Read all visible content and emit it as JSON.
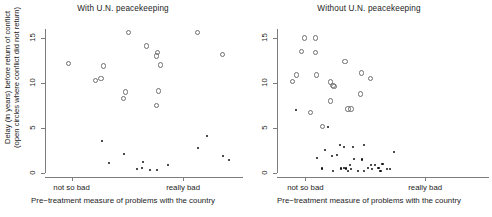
{
  "figure": {
    "background": "#ffffff",
    "marker_open_color": "#6f6f6f",
    "marker_solid_color": "#111111",
    "axis_color": "#7d7d7d"
  },
  "axis": {
    "ylabel_line1": "Delay (in years) before return of conflict",
    "ylabel_line2": "(open circles where conflict did not return)",
    "xlabel": "Pre−treatment measure of problems with the country",
    "xtick_labels": [
      "not so bad",
      "really bad"
    ],
    "ytick_labels": [
      "0",
      "5",
      "10",
      "15"
    ]
  },
  "chart_data": [
    {
      "type": "scatter",
      "title": "With U.N. peacekeeping",
      "xlabel": "Pre−treatment measure of problems with the country",
      "ylabel": "Delay (in years) before return of conflict (open circles where conflict did not return)",
      "xlim": [
        0,
        1
      ],
      "ylim": [
        0,
        16
      ],
      "yticks": [
        0,
        5,
        10,
        15
      ],
      "xticks": [
        0.13,
        0.72
      ],
      "xtick_labels": [
        "not so bad",
        "really bad"
      ],
      "grid": false,
      "legend": null,
      "series": [
        {
          "name": "conflict did not return (open circles)",
          "marker": "open-circle",
          "points": [
            [
              0.115,
              12.2
            ],
            [
              0.255,
              10.3
            ],
            [
              0.285,
              10.5
            ],
            [
              0.3,
              11.9
            ],
            [
              0.43,
              15.6
            ],
            [
              0.415,
              9.0
            ],
            [
              0.405,
              8.3
            ],
            [
              0.525,
              14.1
            ],
            [
              0.585,
              13.4
            ],
            [
              0.58,
              13.0
            ],
            [
              0.6,
              12.0
            ],
            [
              0.59,
              9.1
            ],
            [
              0.58,
              7.5
            ],
            [
              0.795,
              15.6
            ],
            [
              0.93,
              13.2
            ]
          ]
        },
        {
          "name": "conflict returned (solid dots)",
          "marker": "solid-dot",
          "points": [
            [
              0.29,
              3.6
            ],
            [
              0.33,
              1.1
            ],
            [
              0.405,
              2.1
            ],
            [
              0.475,
              0.4
            ],
            [
              0.51,
              1.2
            ],
            [
              0.505,
              0.6
            ],
            [
              0.545,
              0.35
            ],
            [
              0.58,
              0.35
            ],
            [
              0.64,
              0.85
            ],
            [
              0.8,
              2.8
            ],
            [
              0.845,
              4.1
            ],
            [
              0.93,
              1.9
            ],
            [
              0.965,
              1.4
            ]
          ]
        }
      ]
    },
    {
      "type": "scatter",
      "title": "Without U.N. peacekeeping",
      "xlabel": "Pre−treatment measure of problems with the country",
      "ylabel": "Delay (in years) before return of conflict (open circles where conflict did not return)",
      "xlim": [
        0,
        1
      ],
      "ylim": [
        0,
        16
      ],
      "yticks": [
        0,
        5,
        10,
        15
      ],
      "xticks": [
        0.13,
        0.72
      ],
      "xtick_labels": [
        "not so bad",
        "really bad"
      ],
      "grid": false,
      "legend": null,
      "series": [
        {
          "name": "conflict did not return (open circles)",
          "marker": "open-circle",
          "points": [
            [
              0.065,
              10.2
            ],
            [
              0.085,
              10.9
            ],
            [
              0.125,
              15.0
            ],
            [
              0.11,
              13.5
            ],
            [
              0.18,
              15.0
            ],
            [
              0.18,
              13.4
            ],
            [
              0.185,
              10.9
            ],
            [
              0.155,
              6.7
            ],
            [
              0.215,
              5.2
            ],
            [
              0.255,
              10.1
            ],
            [
              0.265,
              9.7
            ],
            [
              0.27,
              9.6
            ],
            [
              0.255,
              8.0
            ],
            [
              0.325,
              12.4
            ],
            [
              0.34,
              7.1
            ],
            [
              0.355,
              7.1
            ],
            [
              0.405,
              11.1
            ],
            [
              0.4,
              8.8
            ],
            [
              0.45,
              10.5
            ]
          ]
        },
        {
          "name": "conflict returned (solid dots)",
          "marker": "solid-dot",
          "points": [
            [
              0.085,
              7.0
            ],
            [
              0.24,
              5.1
            ],
            [
              0.225,
              2.6
            ],
            [
              0.185,
              1.7
            ],
            [
              0.26,
              1.9
            ],
            [
              0.21,
              0.5
            ],
            [
              0.265,
              0.2
            ],
            [
              0.305,
              0.5
            ],
            [
              0.3,
              3.1
            ],
            [
              0.32,
              2.9
            ],
            [
              0.285,
              2.0
            ],
            [
              0.32,
              0.6
            ],
            [
              0.33,
              0.5
            ],
            [
              0.34,
              0.2
            ],
            [
              0.355,
              0.4
            ],
            [
              0.365,
              2.9
            ],
            [
              0.39,
              0.2
            ],
            [
              0.37,
              1.6
            ],
            [
              0.42,
              3.1
            ],
            [
              0.41,
              1.5
            ],
            [
              0.44,
              0.55
            ],
            [
              0.455,
              0.85
            ],
            [
              0.46,
              0.45
            ],
            [
              0.475,
              0.9
            ],
            [
              0.49,
              0.55
            ],
            [
              0.5,
              0.25
            ],
            [
              0.51,
              0.95
            ],
            [
              0.53,
              0.4
            ],
            [
              0.545,
              0.45
            ],
            [
              0.565,
              2.3
            ],
            [
              0.42,
              0.2
            ],
            [
              0.35,
              0.85
            ]
          ]
        }
      ]
    }
  ]
}
